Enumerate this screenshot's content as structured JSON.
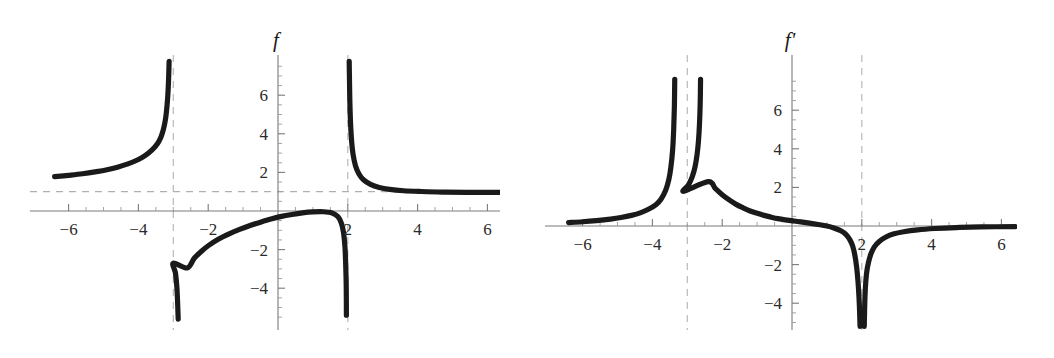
{
  "figure": {
    "background": "#ffffff",
    "curve_color": "#1a1a1a",
    "axis_color": "#7a7a78",
    "asymptote_color": "#b9b9b7"
  },
  "chart_data": [
    {
      "type": "line",
      "title": "",
      "series_label": "f",
      "xlabel": "",
      "ylabel": "",
      "xlim": [
        -6.4,
        6.4
      ],
      "ylim": [
        -5.6,
        7.8
      ],
      "grid": false,
      "legend": "none",
      "x_ticks_major": [
        -6,
        -4,
        -2,
        2,
        4,
        6
      ],
      "x_tick_labels": [
        "-6",
        "-4",
        "-2",
        "2",
        "4",
        "6"
      ],
      "y_ticks_major": [
        -4,
        -2,
        2,
        4,
        6
      ],
      "y_tick_labels": [
        "-4",
        "-2",
        "2",
        "4",
        "6"
      ],
      "x_minor_step": 0.5,
      "y_minor_step": 0.5,
      "annotations": [
        {
          "kind": "vertical-asymptote",
          "x": -3,
          "style": "dashed"
        },
        {
          "kind": "vertical-asymptote",
          "x": 2,
          "style": "dashed"
        },
        {
          "kind": "horizontal-asymptote",
          "y": 1,
          "style": "dashed"
        }
      ],
      "branches": [
        {
          "name": "left-branch",
          "x_range": [
            -6.4,
            -3.18
          ],
          "points": [
            [
              -6.4,
              1.78
            ],
            [
              -6.0,
              1.85
            ],
            [
              -5.6,
              1.93
            ],
            [
              -5.2,
              2.04
            ],
            [
              -4.9,
              2.14
            ],
            [
              -4.6,
              2.27
            ],
            [
              -4.3,
              2.44
            ],
            [
              -4.0,
              2.67
            ],
            [
              -3.8,
              2.88
            ],
            [
              -3.6,
              3.18
            ],
            [
              -3.45,
              3.5
            ],
            [
              -3.35,
              3.85
            ],
            [
              -3.28,
              4.25
            ],
            [
              -3.22,
              4.8
            ],
            [
              -3.18,
              5.45
            ],
            [
              -3.15,
              6.2
            ],
            [
              -3.13,
              7.1
            ],
            [
              -3.12,
              7.75
            ]
          ]
        },
        {
          "name": "middle-branch",
          "x_range": [
            -2.86,
            1.96
          ],
          "points": [
            [
              -2.86,
              -5.6
            ],
            [
              -2.88,
              -4.6
            ],
            [
              -2.9,
              -3.9
            ],
            [
              -2.94,
              -3.2
            ],
            [
              -3.0,
              -2.7
            ],
            [
              -2.6,
              -2.95
            ],
            [
              -2.4,
              -2.45
            ],
            [
              -2.2,
              -2.1
            ],
            [
              -2.0,
              -1.8
            ],
            [
              -1.7,
              -1.45
            ],
            [
              -1.4,
              -1.18
            ],
            [
              -1.1,
              -0.95
            ],
            [
              -0.8,
              -0.75
            ],
            [
              -0.5,
              -0.58
            ],
            [
              -0.2,
              -0.42
            ],
            [
              0.1,
              -0.28
            ],
            [
              0.4,
              -0.18
            ],
            [
              0.7,
              -0.1
            ],
            [
              1.0,
              -0.05
            ],
            [
              1.3,
              -0.04
            ],
            [
              1.55,
              -0.1
            ],
            [
              1.72,
              -0.3
            ],
            [
              1.82,
              -0.65
            ],
            [
              1.88,
              -1.15
            ],
            [
              1.92,
              -1.9
            ],
            [
              1.94,
              -2.8
            ],
            [
              1.955,
              -3.9
            ],
            [
              1.96,
              -5.4
            ]
          ]
        },
        {
          "name": "right-branch",
          "x_range": [
            2.04,
            6.4
          ],
          "points": [
            [
              2.04,
              7.75
            ],
            [
              2.05,
              6.6
            ],
            [
              2.06,
              5.6
            ],
            [
              2.08,
              4.5
            ],
            [
              2.11,
              3.6
            ],
            [
              2.15,
              2.95
            ],
            [
              2.22,
              2.35
            ],
            [
              2.32,
              1.92
            ],
            [
              2.45,
              1.62
            ],
            [
              2.65,
              1.38
            ],
            [
              2.9,
              1.22
            ],
            [
              3.2,
              1.12
            ],
            [
              3.6,
              1.05
            ],
            [
              4.1,
              1.01
            ],
            [
              4.7,
              0.98
            ],
            [
              5.4,
              0.97
            ],
            [
              6.4,
              0.96
            ]
          ]
        }
      ]
    },
    {
      "type": "line",
      "title": "",
      "series_label": "f'",
      "xlabel": "",
      "ylabel": "",
      "xlim": [
        -6.4,
        6.4
      ],
      "ylim": [
        -5.2,
        7.8
      ],
      "grid": false,
      "legend": "none",
      "x_ticks_major": [
        -6,
        -4,
        -2,
        2,
        4,
        6
      ],
      "x_tick_labels": [
        "-6",
        "-4",
        "-2",
        "2",
        "4",
        "6"
      ],
      "y_ticks_major": [
        -4,
        -2,
        2,
        4,
        6
      ],
      "y_tick_labels": [
        "-4",
        "-2",
        "2",
        "4",
        "6"
      ],
      "x_minor_step": 0.5,
      "y_minor_step": 0.5,
      "annotations": [
        {
          "kind": "vertical-asymptote",
          "x": -3,
          "style": "dashed"
        },
        {
          "kind": "vertical-asymptote",
          "x": 2,
          "style": "dashed"
        }
      ],
      "branches": [
        {
          "name": "far-left-branch",
          "x_range": [
            -6.4,
            -3.38
          ],
          "points": [
            [
              -6.4,
              0.18
            ],
            [
              -6.0,
              0.22
            ],
            [
              -5.6,
              0.28
            ],
            [
              -5.2,
              0.36
            ],
            [
              -4.9,
              0.44
            ],
            [
              -4.6,
              0.55
            ],
            [
              -4.35,
              0.68
            ],
            [
              -4.1,
              0.88
            ],
            [
              -3.9,
              1.1
            ],
            [
              -3.75,
              1.4
            ],
            [
              -3.62,
              1.85
            ],
            [
              -3.53,
              2.4
            ],
            [
              -3.47,
              3.05
            ],
            [
              -3.42,
              3.95
            ],
            [
              -3.39,
              5.0
            ],
            [
              -3.37,
              6.2
            ],
            [
              -3.36,
              7.6
            ]
          ]
        },
        {
          "name": "inner-left-branch",
          "x_range": [
            -2.62,
            -0.05
          ],
          "points": [
            [
              -2.62,
              7.6
            ],
            [
              -2.63,
              6.4
            ],
            [
              -2.65,
              5.3
            ],
            [
              -2.68,
              4.4
            ],
            [
              -2.72,
              3.7
            ],
            [
              -2.78,
              3.05
            ],
            [
              -2.86,
              2.55
            ],
            [
              -2.97,
              2.12
            ],
            [
              -3.1,
              1.8
            ],
            [
              -2.4,
              2.3
            ],
            [
              -2.2,
              1.95
            ],
            [
              -2.0,
              1.62
            ],
            [
              -1.8,
              1.35
            ],
            [
              -1.6,
              1.12
            ],
            [
              -1.4,
              0.94
            ],
            [
              -1.2,
              0.78
            ],
            [
              -1.0,
              0.66
            ],
            [
              -0.8,
              0.55
            ],
            [
              -0.6,
              0.46
            ],
            [
              -0.4,
              0.38
            ],
            [
              -0.2,
              0.32
            ],
            [
              0.0,
              0.27
            ]
          ]
        },
        {
          "name": "center-descending-branch",
          "x_range": [
            0.0,
            1.95
          ],
          "points": [
            [
              0.0,
              0.27
            ],
            [
              0.25,
              0.21
            ],
            [
              0.5,
              0.15
            ],
            [
              0.75,
              0.08
            ],
            [
              1.0,
              0.0
            ],
            [
              1.2,
              -0.1
            ],
            [
              1.4,
              -0.25
            ],
            [
              1.55,
              -0.45
            ],
            [
              1.66,
              -0.72
            ],
            [
              1.74,
              -1.05
            ],
            [
              1.8,
              -1.5
            ],
            [
              1.85,
              -2.1
            ],
            [
              1.89,
              -2.85
            ],
            [
              1.92,
              -3.7
            ],
            [
              1.94,
              -4.6
            ],
            [
              1.95,
              -5.2
            ]
          ]
        },
        {
          "name": "right-branch",
          "x_range": [
            2.07,
            6.4
          ],
          "points": [
            [
              2.07,
              -5.2
            ],
            [
              2.08,
              -4.4
            ],
            [
              2.09,
              -3.7
            ],
            [
              2.11,
              -3.0
            ],
            [
              2.14,
              -2.4
            ],
            [
              2.19,
              -1.9
            ],
            [
              2.26,
              -1.45
            ],
            [
              2.36,
              -1.08
            ],
            [
              2.5,
              -0.8
            ],
            [
              2.68,
              -0.58
            ],
            [
              2.9,
              -0.42
            ],
            [
              3.2,
              -0.3
            ],
            [
              3.6,
              -0.2
            ],
            [
              4.1,
              -0.13
            ],
            [
              4.7,
              -0.08
            ],
            [
              5.4,
              -0.05
            ],
            [
              6.4,
              -0.03
            ]
          ]
        }
      ]
    }
  ]
}
